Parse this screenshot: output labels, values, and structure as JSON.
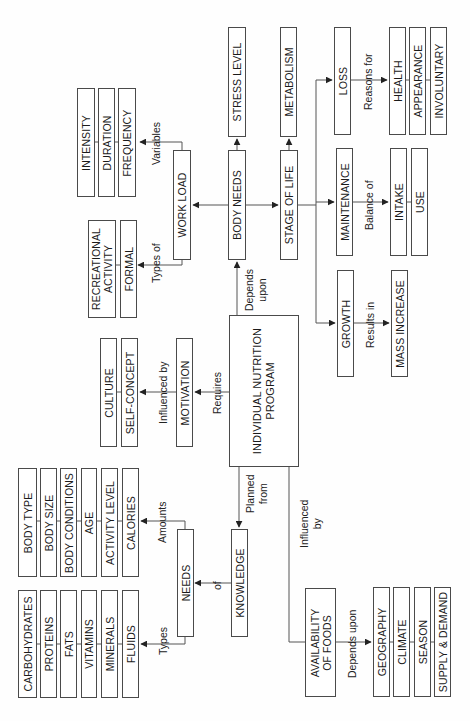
{
  "diagram": {
    "orientation": "rotated-90-ccw",
    "center": "INDIVIDUAL NUTRITION PROGRAM",
    "nodes": {
      "intensity": "INTENSITY",
      "duration": "DURATION",
      "frequency": "FREQUENCY",
      "work_load": "WORK LOAD",
      "body_needs": "BODY NEEDS",
      "stress_level": "STRESS LEVEL",
      "stage_of_life": "STAGE OF LIFE",
      "metabolism": "METABOLISM",
      "loss": "LOSS",
      "maintenance": "MAINTENANCE",
      "growth": "GROWTH",
      "health": "HEALTH",
      "appearance": "APPEARANCE",
      "involuntary": "INVOLUNTARY",
      "intake": "INTAKE",
      "use": "USE",
      "mass_increase": "MASS INCREASE",
      "recreational_activity_1": "RECREATIONAL",
      "recreational_activity_2": "ACTIVITY",
      "formal": "FORMAL",
      "culture": "CULTURE",
      "self_concept": "SELF-CONCEPT",
      "motivation": "MOTIVATION",
      "inp_1": "INDIVIDUAL NUTRITION",
      "inp_2": "PROGRAM",
      "body_type": "BODY TYPE",
      "body_size": "BODY SIZE",
      "body_conditions": "BODY CONDITIONS",
      "age": "AGE",
      "activity_level": "ACTIVITY LEVEL",
      "calories": "CALORIES",
      "carbohydrates": "CARBOHYDRATES",
      "proteins": "PROTEINS",
      "fats": "FATS",
      "vitamins": "VITAMINS",
      "minerals": "MINERALS",
      "fluids": "FLUIDS",
      "needs": "NEEDS",
      "knowledge": "KNOWLEDGE",
      "availability_1": "AVAILABILITY",
      "availability_2": "OF FOODS",
      "geography": "GEOGRAPHY",
      "climate": "CLIMATE",
      "season": "SEASON",
      "supply_demand": "SUPPLY & DEMAND"
    },
    "edge_labels": {
      "variables": "Variables",
      "types_of": "Types of",
      "depends_upon_1": "Depends",
      "depends_upon_2": "upon",
      "requires": "Requires",
      "influenced_by_motivation": "Influenced by",
      "reasons_for": "Reasons for",
      "balance_of": "Balance of",
      "results_in": "Results in",
      "planned_from_1": "Planned",
      "planned_from_2": "from",
      "of": "of",
      "amounts": "Amounts",
      "types": "Types",
      "influenced_by_1": "Influenced",
      "influenced_by_2": "by",
      "depends_upon_foods": "Depends upon"
    }
  }
}
